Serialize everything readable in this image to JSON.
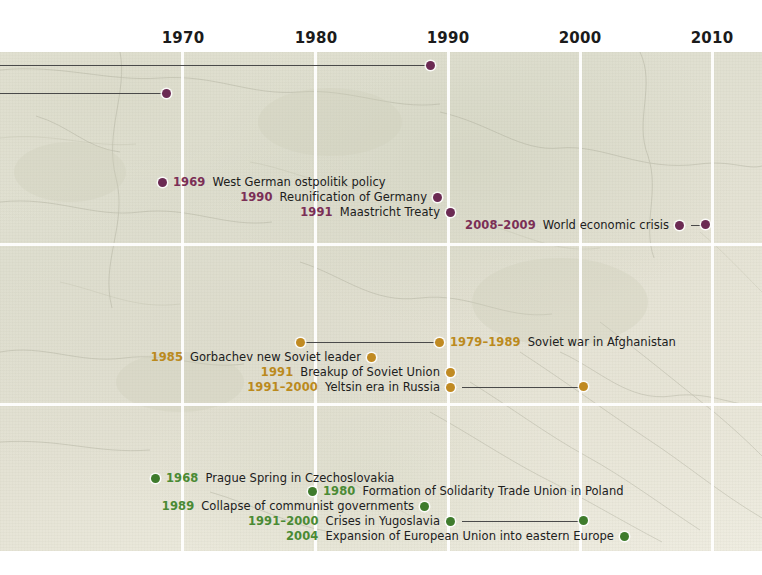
{
  "axis": {
    "ticks": [
      {
        "label": "1970",
        "x": 183
      },
      {
        "label": "1980",
        "x": 316
      },
      {
        "label": "1990",
        "x": 448
      },
      {
        "label": "2000",
        "x": 580
      },
      {
        "label": "2010",
        "x": 712
      }
    ]
  },
  "grid": {
    "vertical_x": [
      181,
      314,
      447,
      579,
      711
    ],
    "horizontal_y": [
      191,
      351
    ],
    "color": "#ffffff"
  },
  "colors": {
    "maroon": "#6b2a53",
    "maroon_year": "#7b2f56",
    "gold": "#c08a22",
    "gold_year": "#bb8a1d",
    "green": "#3e7b2c",
    "green_year": "#4a8a34",
    "leader_line": "#4a4a4a",
    "background": "#e4e2d4"
  },
  "offscreen_lines": [
    {
      "name": "upper-continuation-line",
      "end_x": 430,
      "y": 65,
      "dot": true
    },
    {
      "name": "lower-continuation-line",
      "end_x": 166,
      "y": 93,
      "dot": true
    }
  ],
  "groups": [
    {
      "name": "germany-europe",
      "color_key": "maroon",
      "events": [
        {
          "year": "1969",
          "description": "West German ostpolitik policy",
          "label_side": "right",
          "dot_x": 162,
          "y": 182,
          "bar_length": 0
        },
        {
          "year": "1990",
          "description": "Reunification of Germany",
          "label_side": "left",
          "dot_x": 446,
          "y": 197,
          "bar_length": 0
        },
        {
          "year": "1991",
          "description": "Maastricht Treaty",
          "label_side": "left",
          "dot_x": 459,
          "y": 212,
          "bar_length": 0
        },
        {
          "year": "2008–2009",
          "description": "World economic crisis",
          "label_side": "left",
          "dot_x": 688,
          "y": 225,
          "bar_length": 13
        }
      ]
    },
    {
      "name": "soviet-union",
      "color_key": "gold",
      "events": [
        {
          "year": "1979–1989",
          "description": "Soviet war in Afghanistan",
          "label_side": "right",
          "dot_x": 300,
          "y": 342,
          "bar_length": 132
        },
        {
          "year": "1985",
          "description": "Gorbachev new Soviet leader",
          "label_side": "left",
          "dot_x": 380,
          "y": 357,
          "bar_length": 0
        },
        {
          "year": "1991",
          "description": "Breakup of Soviet Union",
          "label_side": "left",
          "dot_x": 459,
          "y": 372,
          "bar_length": 0
        },
        {
          "year": "1991–2000",
          "description": "Yeltsin era in Russia",
          "label_side": "left",
          "dot_x": 459,
          "y": 387,
          "bar_length": 120
        }
      ]
    },
    {
      "name": "eastern-europe",
      "color_key": "green",
      "events": [
        {
          "year": "1968",
          "description": "Prague Spring in Czechoslovakia",
          "label_side": "right",
          "dot_x": 155,
          "y": 478,
          "bar_length": 0
        },
        {
          "year": "1980",
          "description": "Formation of Solidarity Trade Union in Poland",
          "label_side": "right",
          "dot_x": 312,
          "y": 491,
          "bar_length": 0
        },
        {
          "year": "1989",
          "description": "Collapse of communist governments",
          "label_side": "left",
          "dot_x": 433,
          "y": 506,
          "bar_length": 0
        },
        {
          "year": "1991–2000",
          "description": "Crises in Yugoslavia",
          "label_side": "left",
          "dot_x": 459,
          "y": 521,
          "bar_length": 120
        },
        {
          "year": "2004",
          "description": "Expansion of European Union into eastern Europe",
          "label_side": "left",
          "dot_x": 633,
          "y": 536,
          "bar_length": 0
        }
      ]
    }
  ]
}
